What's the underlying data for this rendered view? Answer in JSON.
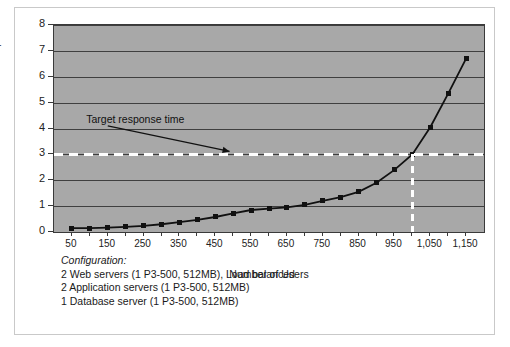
{
  "chart_data": {
    "type": "line",
    "title": "",
    "xlabel": "Number of Users",
    "ylabel": "Response Time",
    "xlim": [
      0,
      1200
    ],
    "ylim": [
      0,
      8
    ],
    "grid": true,
    "legend": "none",
    "x_tick_labels": [
      "50",
      "150",
      "250",
      "350",
      "450",
      "550",
      "650",
      "750",
      "850",
      "950",
      "1,050",
      "1,150"
    ],
    "x_tick_values": [
      50,
      150,
      250,
      350,
      450,
      550,
      650,
      750,
      850,
      950,
      1050,
      1150
    ],
    "y_tick_labels": [
      "0",
      "1",
      "2",
      "3",
      "4",
      "5",
      "6",
      "7",
      "8"
    ],
    "y_tick_values": [
      0,
      1,
      2,
      3,
      4,
      5,
      6,
      7,
      8
    ],
    "x": [
      50,
      100,
      150,
      200,
      250,
      300,
      350,
      400,
      450,
      500,
      550,
      600,
      650,
      700,
      750,
      800,
      850,
      900,
      950,
      1000,
      1050,
      1100,
      1150
    ],
    "values": [
      0.15,
      0.15,
      0.17,
      0.2,
      0.24,
      0.3,
      0.38,
      0.47,
      0.58,
      0.72,
      0.85,
      0.9,
      0.95,
      1.05,
      1.2,
      1.35,
      1.55,
      1.9,
      2.4,
      3.0,
      4.05,
      5.35,
      6.7
    ],
    "series": [
      {
        "name": "Response time",
        "marker": "square",
        "color": "#111111",
        "values": [
          0.15,
          0.15,
          0.17,
          0.2,
          0.24,
          0.3,
          0.38,
          0.47,
          0.58,
          0.72,
          0.85,
          0.9,
          0.95,
          1.05,
          1.2,
          1.35,
          1.55,
          1.9,
          2.4,
          3.0,
          4.05,
          5.35,
          6.7
        ]
      }
    ],
    "annotations": [
      {
        "name": "target-response-time",
        "text": "Target response time",
        "kind": "arrow-label",
        "points_to_y": 3,
        "points_to_x": 490
      }
    ],
    "reference_lines": [
      {
        "name": "target-response-time-line",
        "orientation": "horizontal",
        "y": 3,
        "style": "dashed",
        "color": "#ffffff"
      },
      {
        "name": "capacity-threshold-line",
        "orientation": "vertical",
        "x": 1000,
        "style": "dashed",
        "color": "#ffffff",
        "y_range": [
          0,
          3
        ]
      }
    ],
    "plot_background": "#a8a8a8",
    "gridline_color": "#3f3f3f"
  },
  "configuration": {
    "heading": "Configuration:",
    "lines": [
      "2 Web servers (1 P3-500, 512MB), Load balanced",
      "2 Application servers (1 P3-500, 512MB)",
      "1 Database server (1 P3-500, 512MB)"
    ]
  }
}
